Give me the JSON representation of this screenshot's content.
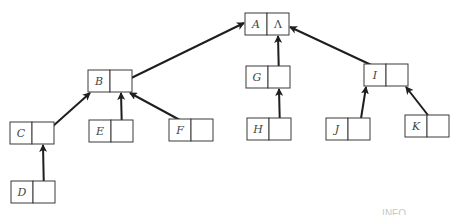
{
  "diagram": {
    "type": "tree-parent-pointer-representation",
    "colors": {
      "stroke": "#1e1e1e",
      "box": "#3a3a3a",
      "label": "#444444",
      "background": "#ffffff"
    },
    "nodes": [
      {
        "id": "A",
        "label": "A",
        "link": "Λ",
        "x": 245,
        "y": 13
      },
      {
        "id": "B",
        "label": "B",
        "link": "",
        "x": 88,
        "y": 70
      },
      {
        "id": "G",
        "label": "G",
        "link": "",
        "x": 246,
        "y": 66
      },
      {
        "id": "I",
        "label": "I",
        "link": "",
        "x": 364,
        "y": 64
      },
      {
        "id": "C",
        "label": "C",
        "link": "",
        "x": 10,
        "y": 122
      },
      {
        "id": "E",
        "label": "E",
        "link": "",
        "x": 89,
        "y": 120
      },
      {
        "id": "F",
        "label": "F",
        "link": "",
        "x": 169,
        "y": 119
      },
      {
        "id": "H",
        "label": "H",
        "link": "",
        "x": 247,
        "y": 118
      },
      {
        "id": "J",
        "label": "J",
        "link": "",
        "x": 326,
        "y": 118
      },
      {
        "id": "K",
        "label": "K",
        "link": "",
        "x": 405,
        "y": 115
      },
      {
        "id": "D",
        "label": "D",
        "link": "",
        "x": 11,
        "y": 181
      }
    ],
    "edges": [
      {
        "from": "B",
        "to": "A"
      },
      {
        "from": "G",
        "to": "A"
      },
      {
        "from": "I",
        "to": "A"
      },
      {
        "from": "C",
        "to": "B"
      },
      {
        "from": "E",
        "to": "B"
      },
      {
        "from": "F",
        "to": "B"
      },
      {
        "from": "H",
        "to": "G"
      },
      {
        "from": "J",
        "to": "I"
      },
      {
        "from": "K",
        "to": "I"
      },
      {
        "from": "D",
        "to": "C"
      }
    ],
    "caption_fragment": "INFO"
  }
}
